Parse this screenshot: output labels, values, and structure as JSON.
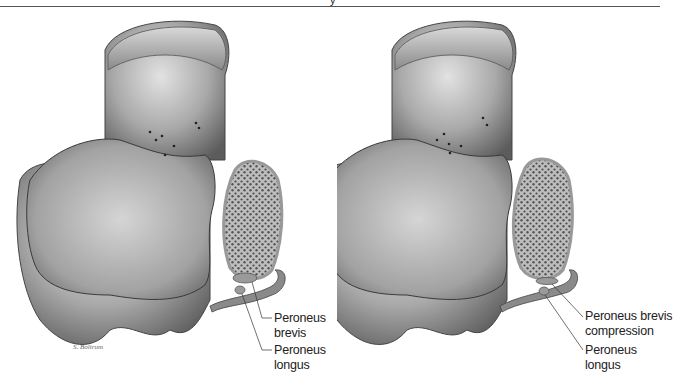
{
  "header": {
    "glyph": "y"
  },
  "figure": {
    "panels": [
      {
        "id": "normal",
        "labels": [
          {
            "text": "Peroneus brevis"
          },
          {
            "text": "Peroneus longus"
          }
        ]
      },
      {
        "id": "compressed",
        "labels": [
          {
            "text": "Peroneus brevis compression",
            "line1": "Peroneus brevis",
            "line2": "compression"
          },
          {
            "text": "Peroneus longus"
          }
        ]
      }
    ],
    "signature": "S. Boltrum",
    "colors": {
      "bone_light": "#d9d9d9",
      "bone_mid": "#a8a8a8",
      "bone_dark": "#5a5a5a",
      "cancellous": "#6a6a6a",
      "leader_line": "#333333",
      "text": "#222222"
    }
  }
}
